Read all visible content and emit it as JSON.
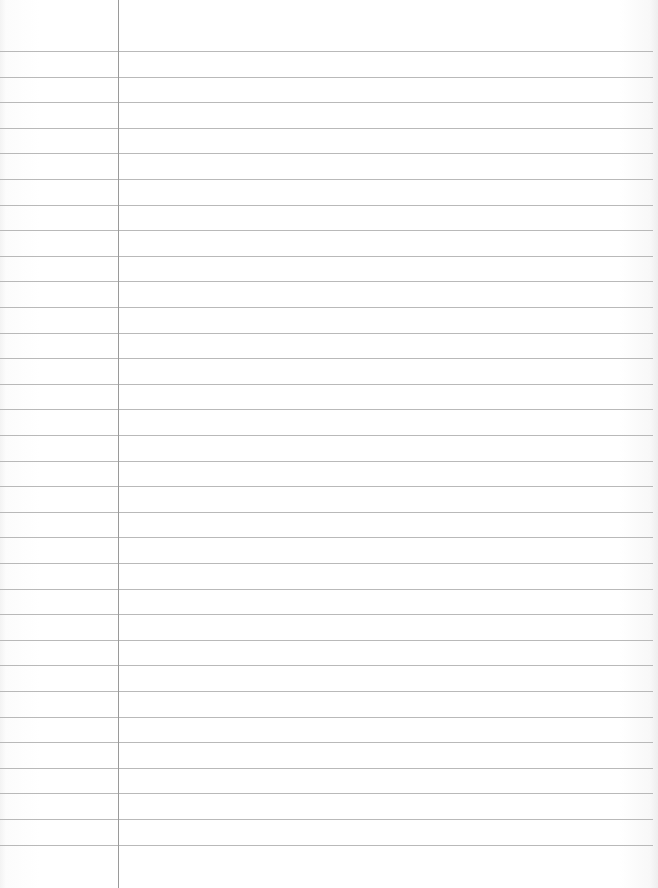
{
  "page": {
    "type": "lined-paper",
    "width": 658,
    "height": 888,
    "background_color": "#ffffff",
    "rule_color": "#b9b9b9",
    "margin_color": "#9a9a9a",
    "margin_x": 118,
    "first_rule_y": 51,
    "rule_spacing": 25.6,
    "rule_count": 32
  }
}
